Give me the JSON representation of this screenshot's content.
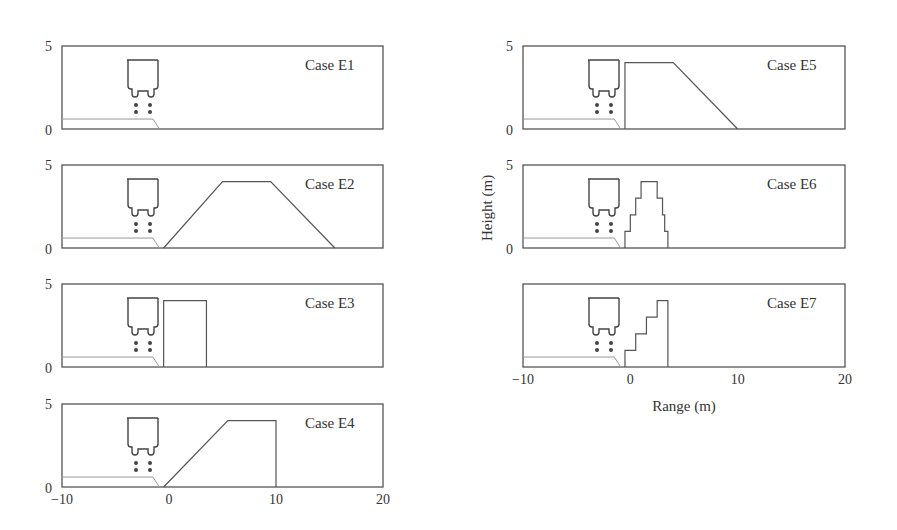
{
  "chart_data": {
    "type": "line",
    "title": "",
    "xlabel": "Range (m)",
    "ylabel": "Height (m)",
    "xlim": [
      -10,
      20
    ],
    "ylim": [
      0,
      5
    ],
    "x_ticks": [
      "-10",
      "0",
      "10",
      "20"
    ],
    "y_ticks": [
      "0",
      "5"
    ],
    "grid": false,
    "panels": [
      {
        "label": "Case E1",
        "terrain": [
          [
            -10,
            0
          ],
          [
            20,
            0
          ]
        ]
      },
      {
        "label": "Case E2",
        "terrain": [
          [
            -0.5,
            0
          ],
          [
            5,
            4
          ],
          [
            9.5,
            4
          ],
          [
            15.5,
            0
          ]
        ]
      },
      {
        "label": "Case E3",
        "terrain": [
          [
            -0.5,
            0
          ],
          [
            -0.5,
            4
          ],
          [
            3.5,
            4
          ],
          [
            3.5,
            0
          ]
        ]
      },
      {
        "label": "Case E4",
        "terrain": [
          [
            -0.5,
            0
          ],
          [
            5.5,
            4
          ],
          [
            10,
            4
          ],
          [
            10,
            0
          ]
        ]
      },
      {
        "label": "Case E5",
        "terrain": [
          [
            -0.5,
            0
          ],
          [
            -0.5,
            4
          ],
          [
            4,
            4
          ],
          [
            10,
            0
          ]
        ]
      },
      {
        "label": "Case E6",
        "terrain": [
          [
            -0.5,
            0
          ],
          [
            -0.5,
            1
          ],
          [
            0,
            1
          ],
          [
            0,
            2
          ],
          [
            0.5,
            2
          ],
          [
            0.5,
            3
          ],
          [
            1,
            3
          ],
          [
            1,
            4
          ],
          [
            2.5,
            4
          ],
          [
            2.5,
            3
          ],
          [
            3,
            3
          ],
          [
            3,
            2
          ],
          [
            3.2,
            2
          ],
          [
            3.2,
            1
          ],
          [
            3.5,
            1
          ],
          [
            3.5,
            0
          ]
        ]
      },
      {
        "label": "Case E7",
        "terrain": [
          [
            -0.5,
            0
          ],
          [
            -0.5,
            1
          ],
          [
            0.5,
            1
          ],
          [
            0.5,
            2
          ],
          [
            1.5,
            2
          ],
          [
            1.5,
            3
          ],
          [
            2.5,
            3
          ],
          [
            2.5,
            4
          ],
          [
            3.5,
            4
          ],
          [
            3.5,
            0
          ]
        ]
      }
    ],
    "vehicle_platform": [
      [
        -10,
        0.6
      ],
      [
        -1.5,
        0.6
      ],
      [
        -0.9,
        0
      ]
    ],
    "annotations": [
      "vehicle outline above platform at x≈-4 to -1"
    ]
  },
  "labels": {
    "xlabel": "Range (m)",
    "ylabel": "Height (m)",
    "cases": [
      "Case E1",
      "Case E2",
      "Case E3",
      "Case E4",
      "Case E5",
      "Case E6",
      "Case E7"
    ],
    "y_top": "5",
    "y_bottom": "0",
    "x_ticks": [
      "−10",
      "0",
      "10",
      "20"
    ]
  }
}
